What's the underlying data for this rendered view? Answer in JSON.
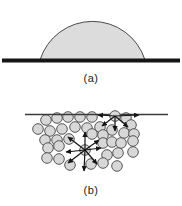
{
  "figure": {
    "panel_a": {
      "label": "(a)",
      "substrate_line": {
        "x1": 2,
        "x2": 180,
        "y": 60.5,
        "thickness": 4,
        "color": "#151515"
      },
      "droplet": {
        "base_left": 40,
        "base_right": 145,
        "base_y": 60,
        "arc_radius": 55,
        "fill": "#dcdcdc",
        "stroke": "#4a4a4a",
        "stroke_width": 1
      }
    },
    "panel_b": {
      "label": "(b)",
      "surface_line": {
        "x1": 25,
        "x2": 168,
        "y": 114.5,
        "thickness": 1.4,
        "color": "#3a3a3a"
      },
      "molecule_style": {
        "radius": 5.3,
        "fill": "#d7d7d7",
        "stroke": "#565656",
        "stroke_width": 1
      },
      "molecules": [
        [
          46,
          120
        ],
        [
          57,
          118
        ],
        [
          68,
          117
        ],
        [
          80,
          117
        ],
        [
          92,
          117
        ],
        [
          126,
          118
        ],
        [
          38,
          129
        ],
        [
          50,
          131
        ],
        [
          62,
          129
        ],
        [
          75,
          127
        ],
        [
          87,
          128
        ],
        [
          100,
          127
        ],
        [
          112,
          130
        ],
        [
          131,
          125
        ],
        [
          45,
          140
        ],
        [
          57,
          140
        ],
        [
          69,
          139
        ],
        [
          92,
          134
        ],
        [
          103,
          135
        ],
        [
          124,
          133
        ],
        [
          134,
          134
        ],
        [
          48,
          148
        ],
        [
          59,
          146
        ],
        [
          103,
          143
        ],
        [
          112,
          142
        ],
        [
          121,
          143
        ],
        [
          133,
          141
        ],
        [
          47,
          158
        ],
        [
          59,
          159
        ],
        [
          70,
          165
        ],
        [
          91,
          164
        ],
        [
          107,
          155
        ],
        [
          118,
          153
        ],
        [
          133,
          152
        ],
        [
          103,
          163
        ],
        [
          117,
          166
        ]
      ],
      "surface_molecule": {
        "cx": 115,
        "cy": 116,
        "arrows": [
          [
            115,
            116,
            98,
            115
          ],
          [
            115,
            116,
            139,
            115
          ],
          [
            115,
            116,
            102,
            126
          ],
          [
            115,
            116,
            128,
            127
          ],
          [
            115,
            116,
            115,
            131
          ]
        ]
      },
      "interior_molecule": {
        "cx": 85,
        "cy": 150,
        "arrows": [
          [
            85,
            150,
            85,
            132
          ],
          [
            85,
            150,
            68,
            137
          ],
          [
            85,
            150,
            99,
            140
          ],
          [
            85,
            150,
            66,
            152
          ],
          [
            85,
            150,
            101,
            148
          ],
          [
            85,
            150,
            68,
            163
          ],
          [
            85,
            150,
            97,
            164
          ],
          [
            85,
            150,
            84,
            171
          ]
        ]
      },
      "arrow": {
        "color": "#151515",
        "width": 1.2
      }
    }
  }
}
